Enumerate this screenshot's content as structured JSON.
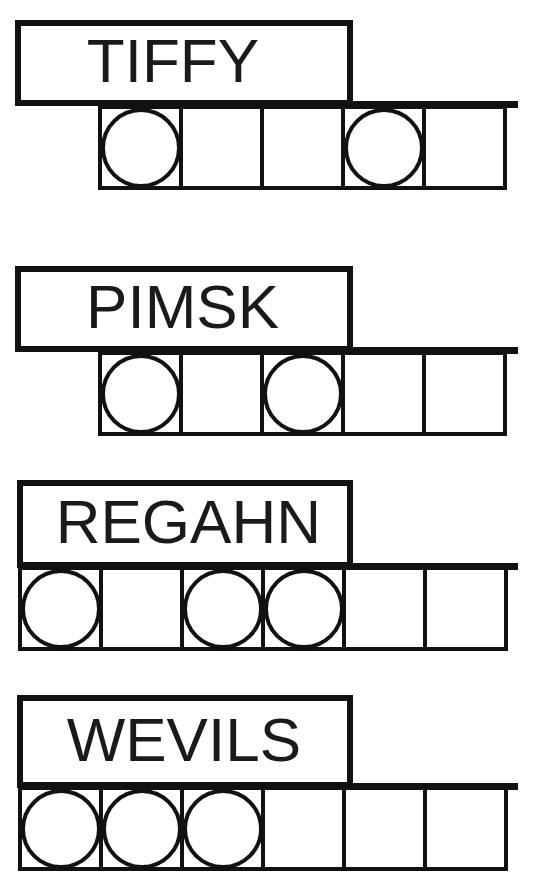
{
  "worksheet": {
    "title": "spelling-word-syllable-worksheet",
    "ink_color": "#111111",
    "paper_color": "#ffffff",
    "cell_marker": "circle",
    "groups": [
      {
        "id": "group-1",
        "word": "TIFFY",
        "cell_count": 5,
        "circles": [
          true,
          false,
          false,
          true,
          false
        ]
      },
      {
        "id": "group-2",
        "word": "PIMSK",
        "cell_count": 5,
        "circles": [
          true,
          false,
          true,
          false,
          false
        ]
      },
      {
        "id": "group-3",
        "word": "REGAHN",
        "cell_count": 6,
        "circles": [
          true,
          false,
          true,
          true,
          false,
          false
        ]
      },
      {
        "id": "group-4",
        "word": "WEVILS",
        "cell_count": 6,
        "circles": [
          true,
          true,
          true,
          false,
          false,
          false
        ]
      }
    ]
  }
}
